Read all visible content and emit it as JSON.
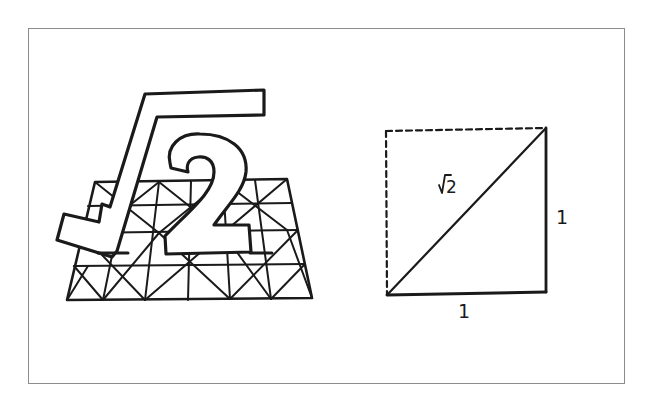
{
  "figure": {
    "colors": {
      "ink": "#1a1a1a",
      "frame": "#8c8c8c",
      "background": "#ffffff"
    },
    "left_panel": {
      "symbol_radical": "√",
      "symbol_number": "2",
      "grid": {
        "description": "trapezoidal grid with diagonal cross-hatching beneath the symbol",
        "rows": 4,
        "cols": 8
      }
    },
    "right_panel": {
      "diagram": "unit square split by diagonal",
      "diagonal_label": "√2",
      "side_label_right": "1",
      "side_label_bottom": "1",
      "dashed_edges": [
        "top",
        "left"
      ],
      "solid_edges": [
        "right",
        "bottom",
        "diagonal"
      ]
    }
  }
}
